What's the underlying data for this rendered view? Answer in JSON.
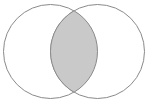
{
  "figure": {
    "name": "venn-diagram-two-set-intersection",
    "title": "",
    "width": 152,
    "height": 103,
    "background_color": "#ffffff",
    "stroke_color": "#8a8a8a",
    "stroke_width": 1,
    "shaded_region": "intersection",
    "shaded_fill_color": "#c9c9c9",
    "unshaded_fill_color": "#ffffff"
  },
  "chart_data": {
    "type": "venn",
    "title": "",
    "sets": [
      {
        "id": "A",
        "label": "",
        "center_x": 50.5,
        "center_y": 51.5,
        "radius": 47.5,
        "fill": "#ffffff",
        "stroke": "#8a8a8a"
      },
      {
        "id": "B",
        "label": "",
        "center_x": 97.5,
        "center_y": 51.5,
        "radius": 47.5,
        "fill": "#ffffff",
        "stroke": "#8a8a8a"
      }
    ],
    "regions": [
      {
        "id": "A-only",
        "shaded": false,
        "fill": "#ffffff"
      },
      {
        "id": "B-only",
        "shaded": false,
        "fill": "#ffffff"
      },
      {
        "id": "A-and-B",
        "shaded": true,
        "fill": "#c9c9c9"
      }
    ],
    "intersection": {
      "shaded": true,
      "fill": "#c9c9c9",
      "top_vertex_x": 74,
      "top_vertex_y": 10,
      "bottom_vertex_x": 74,
      "bottom_vertex_y": 93,
      "left_extent_x": 50,
      "right_extent_x": 98
    },
    "labels": [],
    "legend": [],
    "annotations": []
  }
}
